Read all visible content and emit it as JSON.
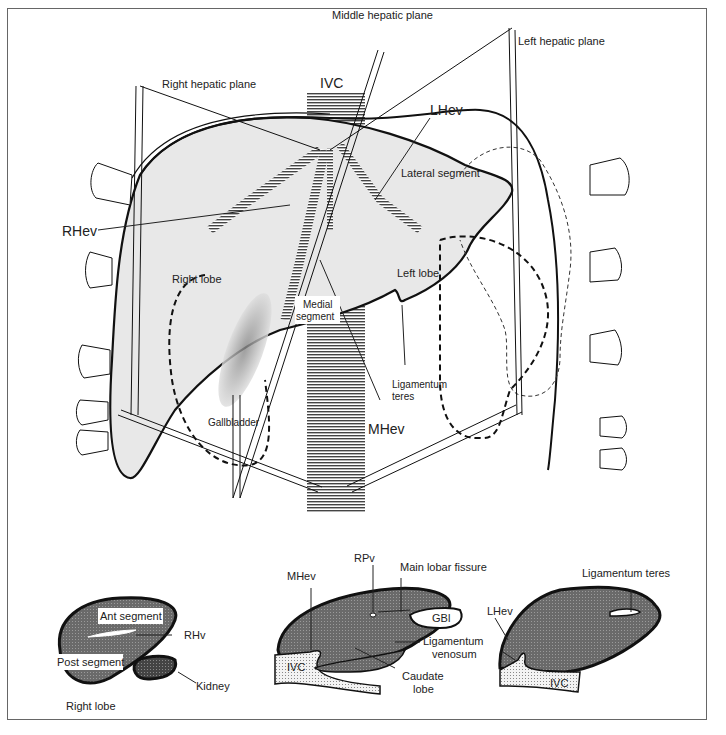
{
  "figure": {
    "main_view": {
      "labels": {
        "middle_hepatic_plane": "Middle hepatic plane",
        "left_hepatic_plane": "Left hepatic plane",
        "right_hepatic_plane": "Right hepatic plane",
        "ivc": "IVC",
        "lhev": "LHev",
        "rhev": "RHev",
        "mhev": "MHev",
        "lateral_segment": "Lateral segment",
        "right_lobe": "Right lobe",
        "left_lobe": "Left lobe",
        "medial_segment_1": "Medial",
        "medial_segment_2": "segment",
        "ligamentum_teres_1": "Ligamentum",
        "ligamentum_teres_2": "teres",
        "gallbladder": "Gallbladder"
      }
    },
    "section_right": {
      "ant_segment": "Ant segment",
      "post_segment": "Post segment",
      "rhv": "RHv",
      "kidney": "Kidney",
      "caption": "Right lobe"
    },
    "section_middle": {
      "rpv": "RPv",
      "main_lobar_fissure": "Main lobar fissure",
      "mhev": "MHev",
      "gbl": "GBl",
      "ligamentum_venosum_1": "Ligamentum",
      "ligamentum_venosum_2": "venosum",
      "ivc": "IVC",
      "caudate_lobe_1": "Caudate",
      "caudate_lobe_2": "lobe"
    },
    "section_left": {
      "ligamentum_teres": "Ligamentum teres",
      "lhev": "LHev",
      "ivc": "IVC"
    },
    "colors": {
      "liver_fill": "#e6e6e6",
      "section_fill": "#6e6e6e",
      "ivc_stripe": "#555555",
      "outline": "#111111"
    }
  }
}
